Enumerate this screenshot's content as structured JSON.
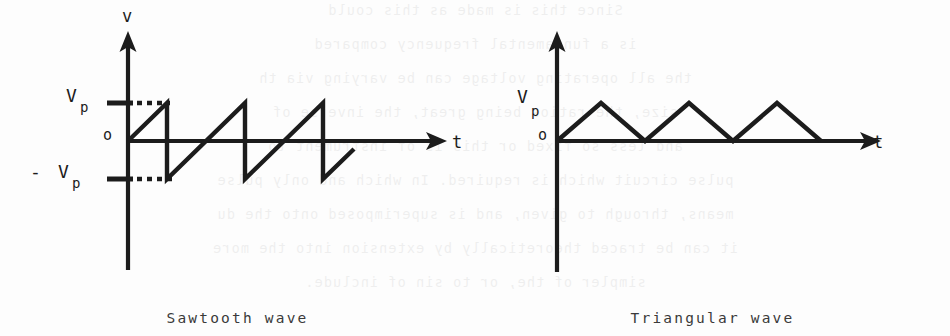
{
  "page": {
    "background_color": "#fdfdfd",
    "ink_color": "#1c1c1c",
    "ghost_text_lines": [
      "Since this is made as this could",
      "is a fundamental frequency compared",
      "the all operating voltage can be varying via th",
      "size, the ratios being great, the inverse of",
      "and less so fixed or this is of instrument to",
      "pulse circuit which is required. In which and only pulse",
      "means, through to given, and is superimposed onto the du",
      "it can be traced theoretically by extension into the more",
      "simpler of the, or to sin of include."
    ]
  },
  "figures": [
    {
      "id": "sawtooth",
      "caption": "Sawtooth wave",
      "y_axis_label": "v",
      "x_axis_label": "t",
      "origin_label": "o",
      "tick_labels": [
        {
          "name": "peak",
          "text": "V",
          "subscript": "p",
          "prefix": ""
        },
        {
          "name": "trough",
          "text": "V",
          "subscript": "p",
          "prefix": "-"
        }
      ],
      "chart_data": {
        "type": "line",
        "title": "Sawtooth wave",
        "xlabel": "t",
        "ylabel": "v",
        "grid": false,
        "legend": "none",
        "ylim": [
          -1,
          1
        ],
        "ytick_values": [
          1,
          0,
          -1
        ],
        "ytick_labels": [
          "Vp",
          "o",
          "-Vp"
        ],
        "waveform": "sawtooth",
        "cycles": 3,
        "period_px": 78,
        "amplitude_label": "Vp",
        "points_normalized": [
          [
            0.0,
            0.0
          ],
          [
            0.5,
            1.0
          ],
          [
            0.5,
            -1.0
          ],
          [
            1.5,
            1.0
          ],
          [
            1.5,
            -1.0
          ],
          [
            2.5,
            1.0
          ],
          [
            2.5,
            -1.0
          ],
          [
            3.5,
            1.0
          ],
          [
            3.5,
            -1.0
          ],
          [
            3.9,
            0.6
          ]
        ],
        "dashed_guides": [
          {
            "level": 1.0,
            "label": "Vp"
          },
          {
            "level": -1.0,
            "label": "-Vp"
          }
        ]
      }
    },
    {
      "id": "triangular",
      "caption": "Triangular wave",
      "y_axis_label": "",
      "x_axis_label": "t",
      "origin_label": "o",
      "tick_labels": [
        {
          "name": "peak",
          "text": "V",
          "subscript": "p",
          "prefix": ""
        }
      ],
      "chart_data": {
        "type": "line",
        "title": "Triangular wave",
        "xlabel": "t",
        "ylabel": "",
        "grid": false,
        "legend": "none",
        "ylim": [
          0,
          1
        ],
        "ytick_values": [
          1,
          0
        ],
        "ytick_labels": [
          "Vp",
          "o"
        ],
        "waveform": "triangular",
        "cycles": 3,
        "period_px": 88,
        "amplitude_label": "Vp",
        "points_normalized": [
          [
            0.0,
            0.0
          ],
          [
            0.5,
            1.0
          ],
          [
            1.0,
            0.0
          ],
          [
            1.5,
            1.0
          ],
          [
            2.0,
            0.0
          ],
          [
            2.5,
            1.0
          ],
          [
            3.0,
            0.0
          ]
        ],
        "dashed_guides": []
      }
    }
  ]
}
